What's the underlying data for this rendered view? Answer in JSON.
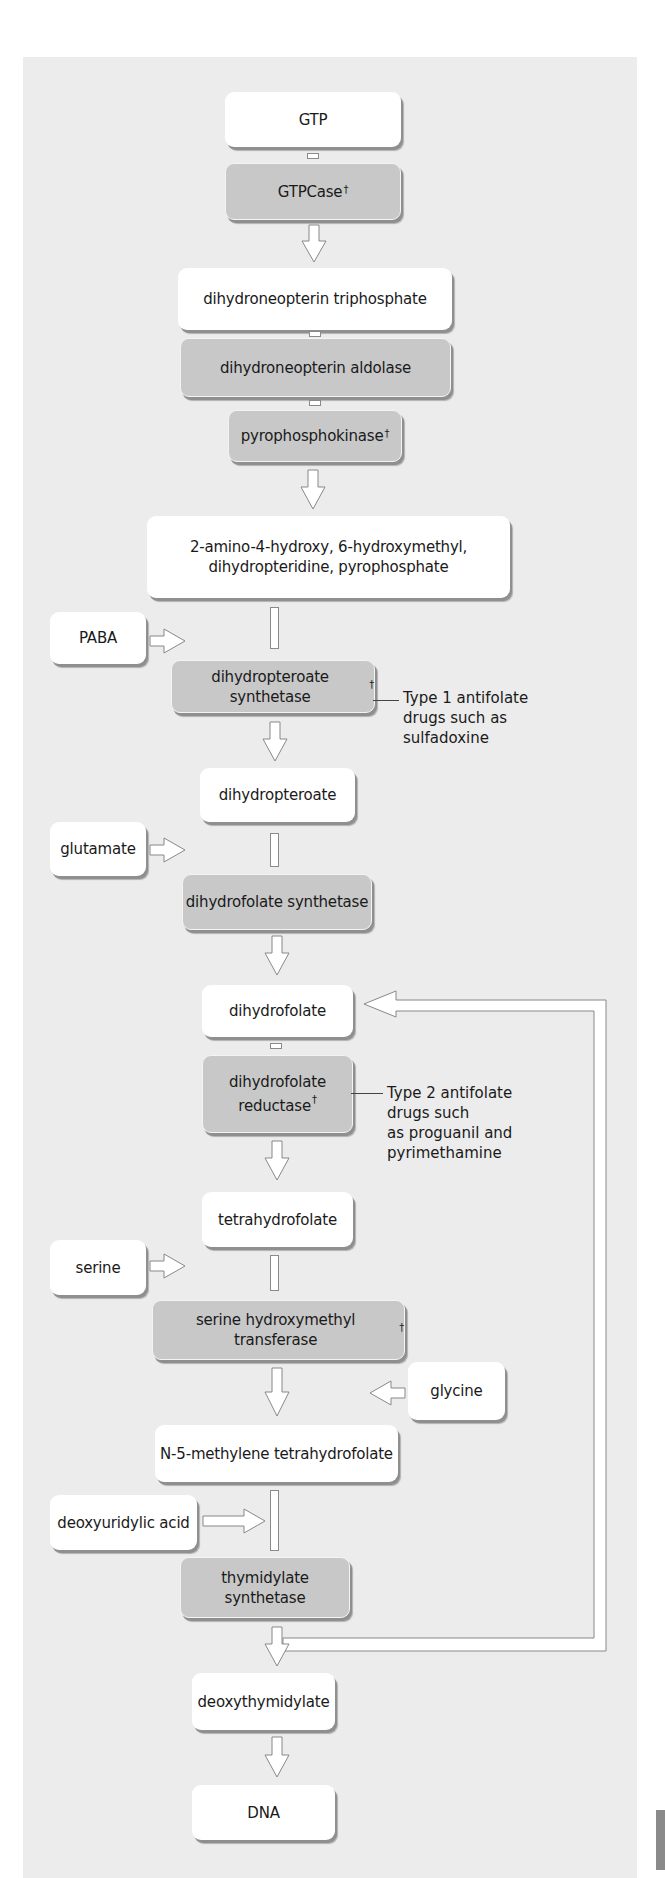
{
  "diagram": {
    "type": "metabolic-pathway-flowchart",
    "legend": {
      "metabolite_box_color": "#ffffff",
      "enzyme_box_color": "#c8c8c8",
      "dagger_note": "†"
    },
    "main_chain": [
      {
        "id": "gtp",
        "label": "GTP",
        "kind": "metabolite"
      },
      {
        "id": "gtpcase",
        "label": "GTPCase",
        "dagger": "†",
        "kind": "enzyme"
      },
      {
        "id": "dntp",
        "label": "dihydroneopterin triphosphate",
        "kind": "metabolite"
      },
      {
        "id": "dna_aldolase",
        "label": "dihydroneopterin aldolase",
        "kind": "enzyme"
      },
      {
        "id": "pyrophosphokinase",
        "label": "pyrophosphokinase",
        "dagger": "†",
        "kind": "enzyme"
      },
      {
        "id": "hmdp",
        "label_line1": "2-amino-4-hydroxy, 6-hydroxymethyl,",
        "label_line2": "dihydropteridine, pyrophosphate",
        "kind": "metabolite"
      },
      {
        "id": "dhps",
        "label": "dihydropteroate synthetase",
        "dagger": "†",
        "kind": "enzyme"
      },
      {
        "id": "dihydropteroate",
        "label": "dihydropteroate",
        "kind": "metabolite"
      },
      {
        "id": "dhfs",
        "label": "dihydrofolate synthetase",
        "kind": "enzyme"
      },
      {
        "id": "dihydrofolate",
        "label": "dihydrofolate",
        "kind": "metabolite"
      },
      {
        "id": "dhfr",
        "label_line1": "dihydrofolate",
        "label_line2": "reductase",
        "dagger": "†",
        "kind": "enzyme"
      },
      {
        "id": "thf",
        "label": "tetrahydrofolate",
        "kind": "metabolite"
      },
      {
        "id": "shmt",
        "label": "serine hydroxymethyl transferase",
        "dagger": "†",
        "kind": "enzyme"
      },
      {
        "id": "methylene_thf",
        "label": "N-5-methylene tetrahydrofolate",
        "kind": "metabolite"
      },
      {
        "id": "ts",
        "label": "thymidylate synthetase",
        "kind": "enzyme"
      },
      {
        "id": "dtmp",
        "label": "deoxythymidylate",
        "kind": "metabolite"
      },
      {
        "id": "dna",
        "label": "DNA",
        "kind": "metabolite"
      }
    ],
    "inputs": [
      {
        "id": "paba",
        "label": "PABA",
        "enters_at": "dhps",
        "side": "left"
      },
      {
        "id": "glutamate",
        "label": "glutamate",
        "enters_at": "dhfs",
        "side": "left"
      },
      {
        "id": "serine",
        "label": "serine",
        "enters_at": "shmt",
        "side": "left"
      },
      {
        "id": "glycine",
        "label": "glycine",
        "enters_at": "methylene_thf",
        "side": "right",
        "direction": "output-from-shmt"
      },
      {
        "id": "dUMP",
        "label": "deoxyuridylic acid",
        "enters_at": "ts",
        "side": "left"
      }
    ],
    "annotations": [
      {
        "id": "type1",
        "attached_to": "dhps",
        "line1": "Type 1 antifolate",
        "line2": "drugs such as",
        "line3": "sulfadoxine"
      },
      {
        "id": "type2",
        "attached_to": "dhfr",
        "line1": "Type 2 antifolate",
        "line2": "drugs such",
        "line3": "as proguanil and",
        "line4": "pyrimethamine"
      }
    ],
    "feedback_loop": {
      "from": "ts",
      "to": "dihydrofolate",
      "description": "recycling arrow from thymidylate synthetase output back to dihydrofolate"
    }
  }
}
